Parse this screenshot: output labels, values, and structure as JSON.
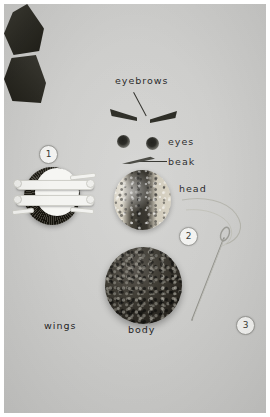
{
  "image": {
    "title": "Pompom owl craft component layout",
    "background_color": "#c9c9c7",
    "frame_color": "#ffffff",
    "label_color": "#24241f",
    "felt_color": "#2b2a23",
    "badge_fill": "#f2f2f0",
    "badge_text_color": "#3a3a34"
  },
  "labels": {
    "eyebrows": "eyebrows",
    "eyes": "eyes",
    "beak": "beak",
    "head": "head",
    "wings": "wings",
    "body": "body"
  },
  "badges": [
    {
      "number": "1",
      "refers_to": "pompom maker with yarn wound on it"
    },
    {
      "number": "2",
      "refers_to": "needle threaded with yarn"
    },
    {
      "number": "3",
      "refers_to": "felt wing piece"
    }
  ],
  "parts": [
    {
      "name": "eyebrows",
      "count": 2,
      "material": "felt",
      "color": "#26261f"
    },
    {
      "name": "eyes",
      "count": 2,
      "material": "felt dots",
      "color": "#1d1d18"
    },
    {
      "name": "beak",
      "count": 1,
      "material": "felt",
      "color": "#3d3d36"
    },
    {
      "name": "head",
      "count": 1,
      "material": "two-tone yarn pompom",
      "color": "#d6d0c0"
    },
    {
      "name": "body",
      "count": 1,
      "material": "yarn pompom",
      "color": "#3a372f"
    },
    {
      "name": "wings",
      "count": 2,
      "material": "felt",
      "color": "#2b2a23"
    },
    {
      "name": "pompom maker",
      "count": 1,
      "material": "white plastic",
      "color": "#f4f4f1"
    },
    {
      "name": "needle and thread",
      "count": 1,
      "material": "steel needle",
      "color": "#9c9c96"
    }
  ]
}
